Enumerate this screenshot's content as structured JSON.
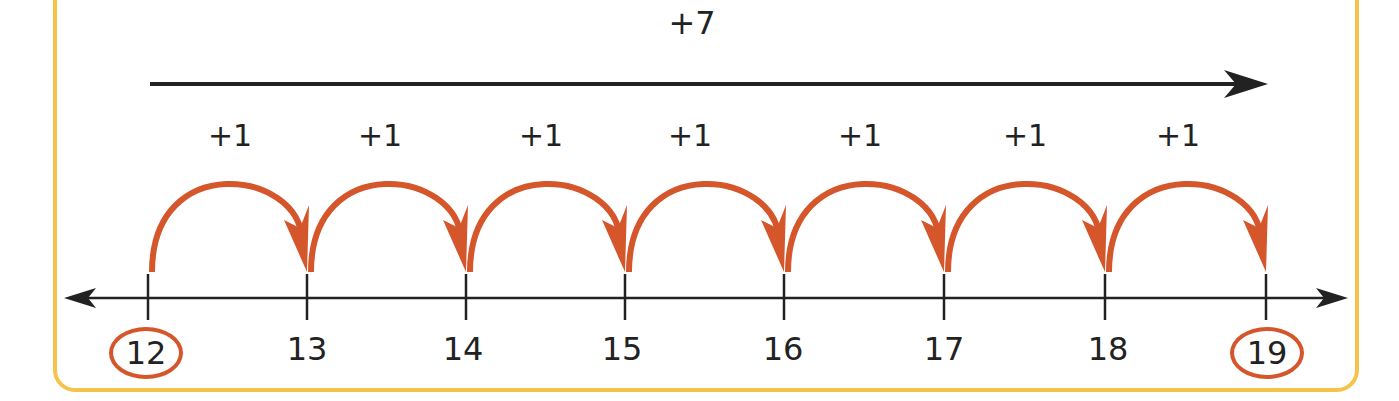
{
  "diagram": {
    "total_jump_label": "+7",
    "start": "12",
    "end": "19",
    "ticks": [
      "12",
      "13",
      "14",
      "15",
      "16",
      "17",
      "18",
      "19"
    ],
    "hop_labels": [
      "+1",
      "+1",
      "+1",
      "+1",
      "+1",
      "+1",
      "+1"
    ],
    "circled": [
      "12",
      "19"
    ],
    "colors": {
      "hop": "#d4562a",
      "border": "#f5c24a",
      "line": "#222222"
    }
  }
}
